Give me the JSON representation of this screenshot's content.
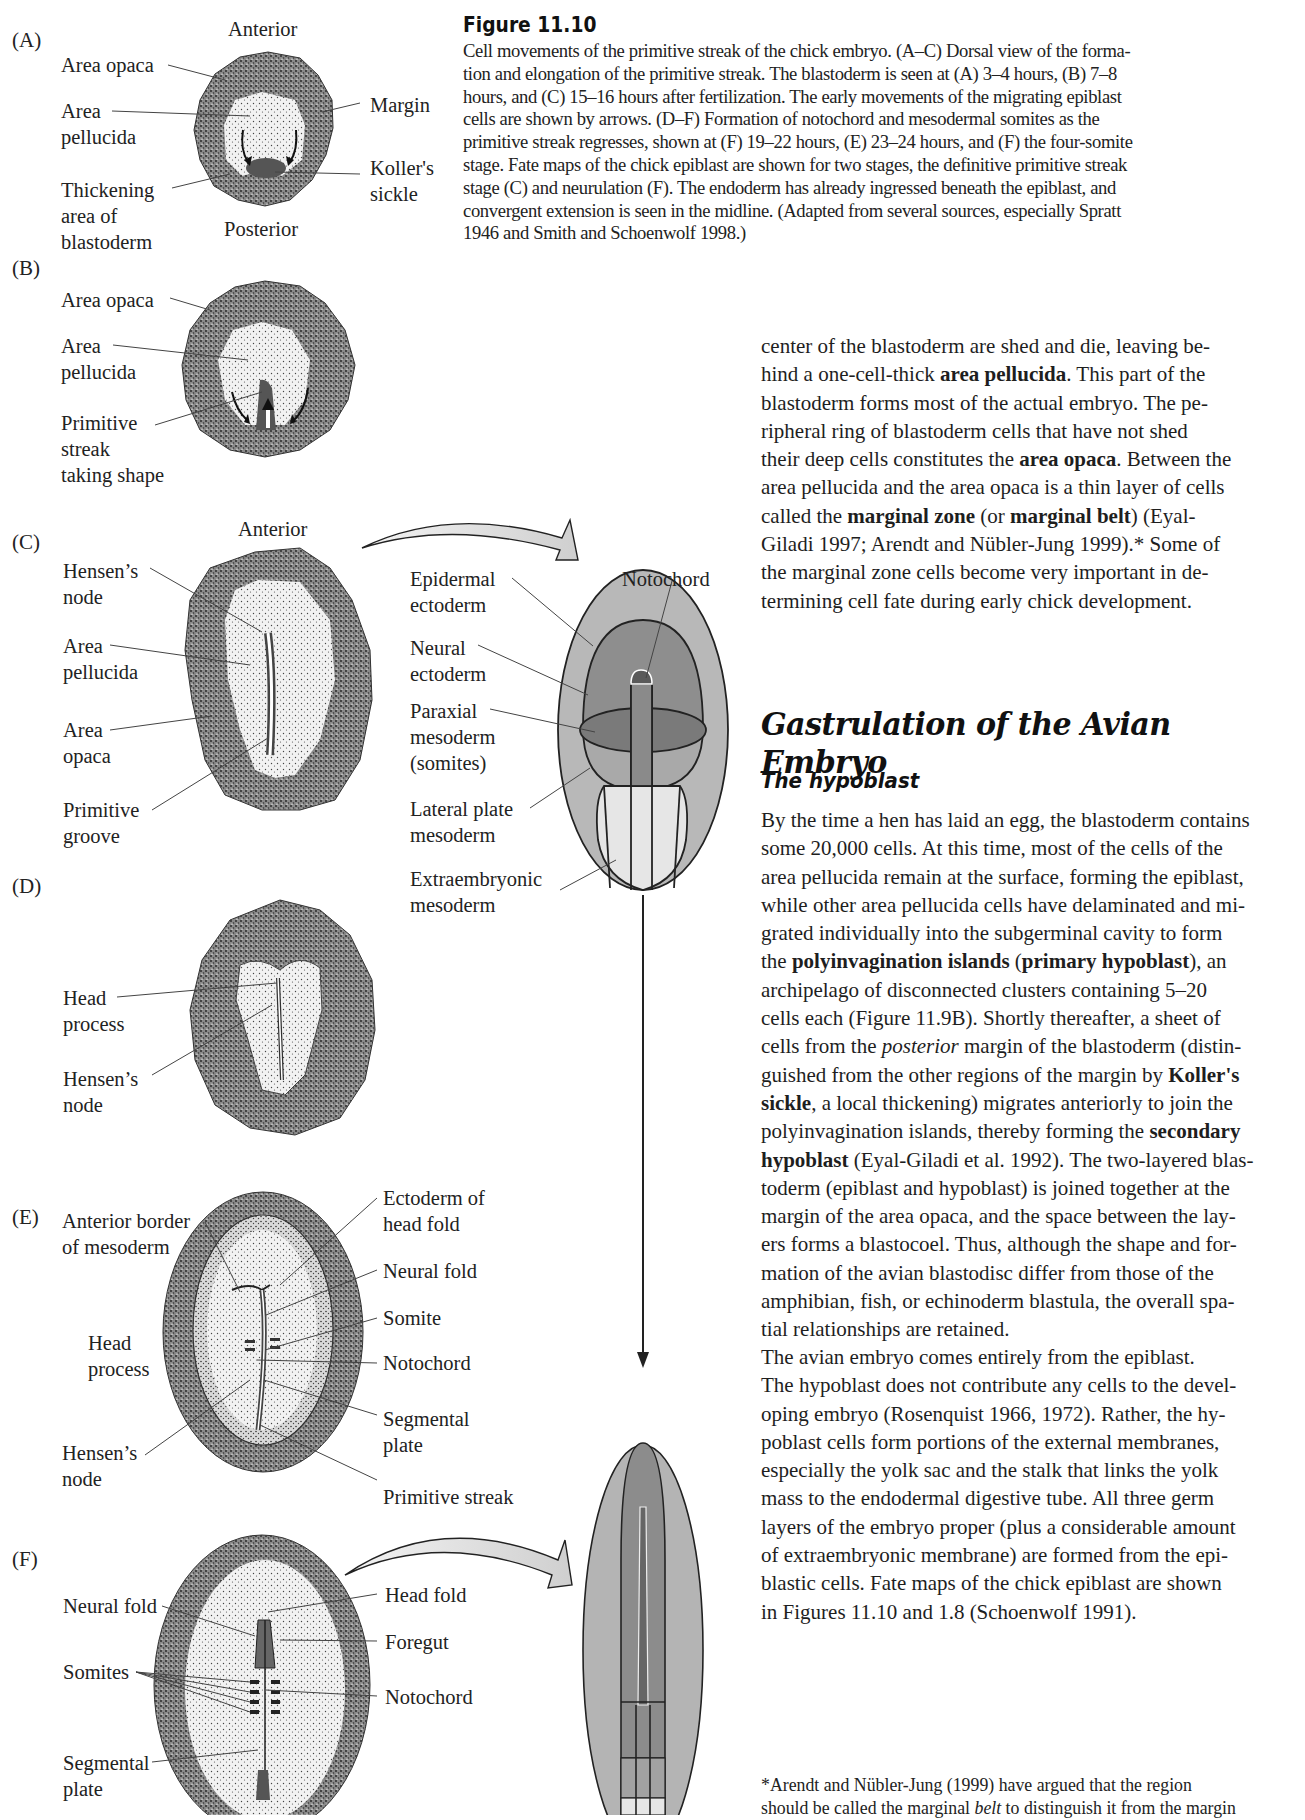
{
  "figure": {
    "title": "Figure 11.10",
    "caption": "Cell movements of the primitive streak of the chick embryo. (A–C) Dorsal view of the formation and elongation of the primitive streak. The blastoderm is seen at (A) 3–4 hours, (B) 7–8 hours, and (C) 15–16 hours after fertilization. The early movements of the migrating epiblast cells are shown by arrows. (D–F) Formation of notochord and mesodermal somites as the primitive streak regresses, shown at (F) 19–22 hours, (E) 23–24 hours, and (F) the four-somite stage. Fate maps of the chick epiblast are shown for two stages, the definitive primitive streak stage (C) and neurulation (F). The endoderm has already ingressed beneath the epiblast, and convergent extension is seen in the midline. (Adapted from several sources, especially Spratt 1946 and Smith and Schoenwolf 1998.)",
    "caption_lines": [
      "Cell movements of the primitive streak of the chick embryo. (A–C) Dorsal view of the forma-",
      "tion and elongation of the primitive streak. The blastoderm is seen at (A) 3–4 hours, (B) 7–8",
      "hours, and (C) 15–16 hours after fertilization. The early movements of the migrating epiblast",
      "cells are shown by arrows. (D–F) Formation of notochord and mesodermal somites as the",
      "primitive streak regresses, shown at (F) 19–22 hours, (E) 23–24 hours, and (F) the four-somite",
      "stage. Fate maps of the chick epiblast are shown for two stages, the definitive primitive streak",
      "stage (C) and neurulation (F). The endoderm has already ingressed beneath the epiblast, and",
      "convergent extension is seen in the midline. (Adapted from several sources, especially Spratt",
      "1946 and Smith and Schoenwolf 1998.)"
    ],
    "panels": {
      "A": {
        "letter": "(A)",
        "anterior": "Anterior",
        "posterior": "Posterior",
        "labels": {
          "area_opaca": "Area opaca",
          "area_pellucida": "Area\npellucida",
          "thickening": "Thickening\narea of\nblastoderm",
          "margin": "Margin",
          "kollers_sickle": "Koller's\nsickle"
        }
      },
      "B": {
        "letter": "(B)",
        "labels": {
          "area_opaca": "Area opaca",
          "area_pellucida": "Area\npellucida",
          "primitive_streak": "Primitive\nstreak\ntaking shape"
        }
      },
      "C": {
        "letter": "(C)",
        "anterior": "Anterior",
        "labels": {
          "hensens_node": "Hensen’s\nnode",
          "area_pellucida": "Area\npellucida",
          "area_opaca": "Area\nopaca",
          "primitive_groove": "Primitive\ngroove"
        }
      },
      "fate_map_1": {
        "labels": {
          "epidermal_ectoderm": "Epidermal\nectoderm",
          "neural_ectoderm": "Neural\nectoderm",
          "paraxial_mesoderm": "Paraxial\nmesoderm\n(somites)",
          "lateral_plate": "Lateral plate\nmesoderm",
          "extraembryonic": "Extraembryonic\nmesoderm",
          "notochord": "Notochord"
        },
        "colors": {
          "epidermal": "#b8b8b8",
          "neural": "#8e8e8e",
          "paraxial": "#7a7a7a",
          "lateral": "#a9a9a9",
          "extraembryonic": "#e6e6e6",
          "notochord": "#5a5a5a"
        }
      },
      "D": {
        "letter": "(D)",
        "labels": {
          "head_process": "Head\nprocess",
          "hensens_node": "Hensen’s\nnode"
        }
      },
      "E": {
        "letter": "(E)",
        "labels": {
          "anterior_border": "Anterior border\nof mesoderm",
          "head_process": "Head\nprocess",
          "hensens_node": "Hensen’s\nnode",
          "ectoderm_head_fold": "Ectoderm of\nhead fold",
          "neural_fold": "Neural fold",
          "somite": "Somite",
          "notochord": "Notochord",
          "segmental_plate": "Segmental\nplate",
          "primitive_streak": "Primitive streak"
        }
      },
      "F": {
        "letter": "(F)",
        "labels": {
          "neural_fold": "Neural fold",
          "somites": "Somites",
          "segmental_plate": "Segmental\nplate",
          "head_fold": "Head fold",
          "foregut": "Foregut",
          "notochord": "Notochord"
        }
      }
    }
  },
  "body": {
    "para1_lines": [
      [
        "center of the blastoderm are shed and die, leaving be-"
      ],
      [
        "hind a one-cell-thick ",
        {
          "b": "area pellucida"
        },
        ". This part of the"
      ],
      [
        "blastoderm forms most of the actual embryo. The pe-"
      ],
      [
        "ripheral ring of blastoderm cells that have not shed"
      ],
      [
        "their deep cells constitutes the ",
        {
          "b": "area opaca"
        },
        ". Between the"
      ],
      [
        "area pellucida and the area opaca is a thin layer of cells"
      ],
      [
        "called the ",
        {
          "b": "marginal zone"
        },
        " (or ",
        {
          "b": "marginal belt"
        },
        ") (Eyal-"
      ],
      [
        "Giladi 1997; Arendt and Nübler-Jung 1999).* Some of"
      ],
      [
        "the marginal zone cells become very important in de-"
      ],
      [
        "termining cell fate during early chick development."
      ]
    ],
    "section_heading": "Gastrulation of the Avian Embryo",
    "subheading": "The hypoblast",
    "para2_lines": [
      [
        "By the time a hen has laid an egg, the blastoderm contains"
      ],
      [
        "some 20,000 cells. At this time, most of the cells of the"
      ],
      [
        "area pellucida remain at the surface, forming the epiblast,"
      ],
      [
        "while other area pellucida cells have delaminated and mi-"
      ],
      [
        "grated individually into the subgerminal cavity to form"
      ],
      [
        "the ",
        {
          "b": "polyinvagination islands"
        },
        " (",
        {
          "b": "primary hypoblast"
        },
        "), an"
      ],
      [
        "archipelago of disconnected clusters containing 5–20"
      ],
      [
        "cells each (Figure 11.9B). Shortly thereafter, a sheet of"
      ],
      [
        "cells from the ",
        {
          "i": "posterior"
        },
        " margin of the blastoderm (distin-"
      ],
      [
        "guished from the other regions of the margin by ",
        {
          "b": "Koller's"
        }
      ],
      [
        {
          "b": "sickle"
        },
        ", a local thickening) migrates anteriorly to join the"
      ],
      [
        "polyinvagination islands, thereby forming the ",
        {
          "b": "secondary"
        }
      ],
      [
        {
          "b": "hypoblast"
        },
        " (Eyal-Giladi et al. 1992). The two-layered blas-"
      ],
      [
        "toderm (epiblast and hypoblast) is joined together at the"
      ],
      [
        "margin of the area opaca, and the space between the lay-"
      ],
      [
        "ers forms a blastocoel. Thus, although the shape and for-"
      ],
      [
        "mation of the avian blastodisc differ from those of the"
      ],
      [
        "amphibian, fish, or echinoderm blastula, the overall spa-"
      ],
      [
        "tial relationships are retained."
      ]
    ],
    "para3_lines": [
      [
        "        The avian embryo comes entirely from the epiblast."
      ],
      [
        "The hypoblast does not contribute any cells to the devel-"
      ],
      [
        "oping embryo (Rosenquist 1966, 1972). Rather, the hy-"
      ],
      [
        "poblast cells form portions of the external membranes,"
      ],
      [
        "especially the yolk sac and the stalk that links the yolk"
      ],
      [
        "mass to the endodermal digestive tube. All three germ"
      ],
      [
        "layers of the embryo proper (plus a considerable amount"
      ],
      [
        "of extraembryonic membrane) are formed from the epi-"
      ],
      [
        "blastic cells. Fate maps of the chick epiblast are shown"
      ],
      [
        "in Figures 11.10 and 1.8 (Schoenwolf 1991)."
      ]
    ],
    "footnote_lines": [
      [
        "      *Arendt and Nübler-Jung (1999) have argued that the region"
      ],
      [
        "should be called the marginal ",
        {
          "i": "belt"
        },
        " to distinguish it from the margin"
      ]
    ]
  }
}
